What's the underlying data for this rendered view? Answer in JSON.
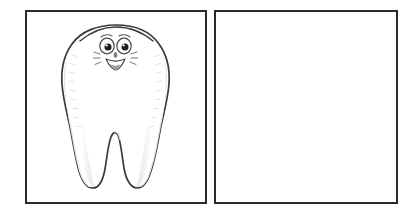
{
  "page": {
    "type": "worksheet",
    "background_color": "#ffffff",
    "panel_count": 2
  },
  "panels": [
    {
      "id": "left-panel",
      "label": "Example panel with tooth illustration",
      "border_color": "#2a2a2a",
      "fill_color": "#ffffff",
      "content": "tooth-illustration"
    },
    {
      "id": "right-panel",
      "label": "Blank drawing panel",
      "border_color": "#2a2a2a",
      "fill_color": "#ffffff",
      "content": "blank"
    }
  ],
  "illustration": {
    "name": "cartoon-tooth",
    "description": "Smiling cartoon molar tooth with two roots",
    "outline_color": "#3a3a3a",
    "fill_color": "#ffffff",
    "shading_color": "#e9e9e9",
    "face": {
      "eyes": 2,
      "eye_outline_color": "#4a4a4a",
      "pupil_color": "#1d1d1d",
      "highlight_color": "#ffffff",
      "nose_color": "#5a5a5a",
      "mouth_outline_color": "#4a4a4a",
      "tongue_color": "#9a9a9a",
      "cheek_lines": 6,
      "expression": "smiling"
    },
    "roots": 2
  }
}
